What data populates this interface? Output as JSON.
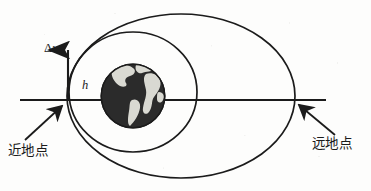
{
  "figure": {
    "kind": "orbital-transfer-diagram",
    "background_color": "#fdfdfc",
    "stroke_color": "#1b1b1b",
    "labels": {
      "perigee": "近地点",
      "apogee": "远地点",
      "delta_v_symbol": "Δ",
      "delta_v_variable": "v",
      "altitude": "h"
    },
    "icons": {
      "earth": "earth-globe-icon",
      "delta_v_arrow": "up-arrow-icon",
      "perigee_pointer": "arrow-up-right-icon",
      "apogee_pointer": "arrow-up-left-icon"
    },
    "geometry": {
      "axis_line": {
        "x1": 20,
        "y1": 100,
        "x2": 326,
        "y2": 100
      },
      "earth": {
        "cx": 133,
        "cy": 96,
        "r": 32
      },
      "circular_orbit": {
        "cx": 133,
        "cy": 92,
        "rx": 64,
        "ry": 60
      },
      "transfer_ellipse": {
        "cx": 181,
        "cy": 96,
        "rx": 114,
        "ry": 82
      },
      "delta_v_arrow": {
        "x": 68,
        "y_base": 100,
        "y_tip": 44
      },
      "perigee_point": {
        "x": 68,
        "y": 100
      },
      "apogee_point": {
        "x": 295,
        "y": 100
      },
      "perigee_arrow": {
        "x1": 27,
        "y1": 138,
        "x2": 63,
        "y2": 105
      },
      "apogee_arrow": {
        "x1": 333,
        "y1": 134,
        "x2": 300,
        "y2": 104
      }
    },
    "earth_colors": {
      "ocean": "#2b2b2b",
      "land": "#d9d9d2",
      "outline": "#1b1b1b"
    }
  }
}
